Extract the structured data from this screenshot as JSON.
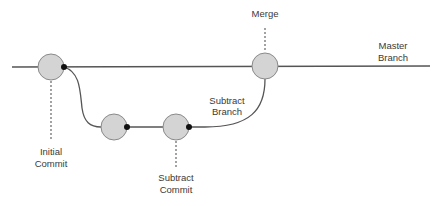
{
  "diagram": {
    "type": "git-branch-diagram",
    "colors": {
      "line": "#555555",
      "node_fill": "#d4d4d4",
      "node_stroke": "#8a8a8a",
      "dot": "#111111",
      "text": "#3a3a3a"
    },
    "labels": {
      "merge": "Merge",
      "master_line1": "Master",
      "master_line2": "Branch",
      "subtract_branch_line1": "Subtract",
      "subtract_branch_line2": "Branch",
      "initial_commit_line1": "Initial",
      "initial_commit_line2": "Commit",
      "subtract_commit_line1": "Subtract",
      "subtract_commit_line2": "Commit"
    },
    "nodes": [
      {
        "id": "initial-commit",
        "branch": "master"
      },
      {
        "id": "branch-commit-1",
        "branch": "subtract"
      },
      {
        "id": "subtract-commit",
        "branch": "subtract"
      },
      {
        "id": "merge-commit",
        "branch": "master"
      }
    ]
  }
}
